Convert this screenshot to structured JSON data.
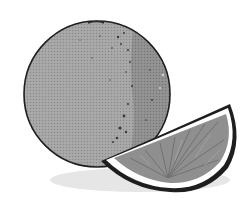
{
  "image": {
    "subject": "Grayscale illustration of a whole orange with an orange wedge",
    "palette": {
      "background": "#ffffff",
      "peel": "#a2a2a2",
      "peel_shade": "#8c8c8c",
      "outline": "#1e1e1e",
      "pulp": "#8e8e8e",
      "pulp_segment": "#6f6f6f",
      "pith": "#ffffff",
      "shadow": "#e4e4e4"
    },
    "objects": [
      {
        "name": "whole-orange",
        "shape": "circle",
        "cx": 97,
        "cy": 94,
        "r": 73
      },
      {
        "name": "orange-wedge",
        "shape": "half-slice",
        "bounds": [
          100,
          103,
          238,
          193
        ]
      }
    ]
  }
}
